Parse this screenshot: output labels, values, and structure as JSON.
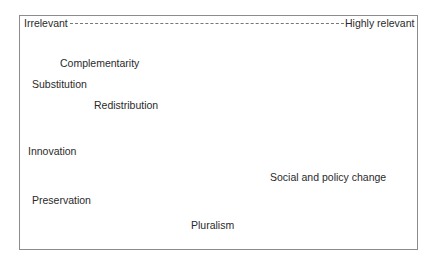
{
  "scale": {
    "left_label": "Irrelevant",
    "right_label": "Highly relevant"
  },
  "items": [
    {
      "label": "Complementarity"
    },
    {
      "label": "Substitution"
    },
    {
      "label": "Redistribution"
    },
    {
      "label": "Innovation"
    },
    {
      "label": "Social and policy change"
    },
    {
      "label": "Preservation"
    },
    {
      "label": "Pluralism"
    }
  ]
}
